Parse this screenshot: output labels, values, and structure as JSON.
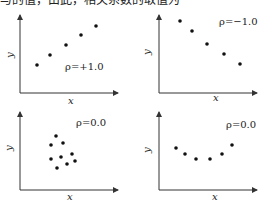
{
  "header": {
    "text": "与的值，由此，相关系数的取值为"
  },
  "chart_data": [
    {
      "type": "scatter",
      "title": "",
      "annotation": "ρ=+1.0",
      "xlabel": "x",
      "ylabel": "y",
      "grid": false,
      "points": [
        [
          1,
          1
        ],
        [
          2,
          2
        ],
        [
          3,
          3
        ],
        [
          4,
          4
        ],
        [
          5,
          5
        ]
      ],
      "px": {
        "axis_x": 20,
        "axis_y": 93,
        "x_end": 118,
        "y_top": 15,
        "label_pos": [
          65,
          70
        ],
        "xlabel_pos": [
          68,
          104
        ],
        "ylabel_pos": [
          13,
          58
        ],
        "dots": [
          [
            37,
            65
          ],
          [
            50,
            55
          ],
          [
            66,
            45
          ],
          [
            81,
            35
          ],
          [
            96,
            26
          ]
        ]
      }
    },
    {
      "type": "scatter",
      "title": "",
      "annotation": "ρ=−1.0",
      "xlabel": "x",
      "ylabel": "y",
      "grid": false,
      "points": [
        [
          1,
          5
        ],
        [
          2,
          4
        ],
        [
          3,
          3
        ],
        [
          4,
          2
        ],
        [
          5,
          1
        ]
      ],
      "px": {
        "axis_x": 159,
        "axis_y": 93,
        "x_end": 257,
        "y_top": 15,
        "label_pos": [
          219,
          25
        ],
        "xlabel_pos": [
          213,
          101
        ],
        "ylabel_pos": [
          150,
          55
        ],
        "dots": [
          [
            180,
            21
          ],
          [
            192,
            31
          ],
          [
            207,
            44
          ],
          [
            224,
            54
          ],
          [
            240,
            64
          ]
        ]
      }
    },
    {
      "type": "scatter",
      "title": "",
      "annotation": "ρ=0.0",
      "xlabel": "x",
      "ylabel": "y",
      "grid": false,
      "points": [
        [
          2,
          5
        ],
        [
          1,
          4
        ],
        [
          3,
          4
        ],
        [
          1,
          2.5
        ],
        [
          2.5,
          2.5
        ],
        [
          2,
          1.5
        ],
        [
          4,
          3
        ],
        [
          3.5,
          2
        ],
        [
          4.5,
          2.2
        ]
      ],
      "px": {
        "axis_x": 20,
        "axis_y": 190,
        "x_end": 118,
        "y_top": 112,
        "label_pos": [
          76,
          126
        ],
        "xlabel_pos": [
          67,
          200
        ],
        "ylabel_pos": [
          12,
          151
        ],
        "dots": [
          [
            56,
            136
          ],
          [
            51,
            145
          ],
          [
            63,
            143
          ],
          [
            51,
            159
          ],
          [
            61,
            157
          ],
          [
            57,
            168
          ],
          [
            72,
            154
          ],
          [
            67,
            164
          ],
          [
            75,
            161
          ]
        ]
      }
    },
    {
      "type": "scatter",
      "title": "",
      "annotation": "ρ=0.0",
      "xlabel": "x",
      "ylabel": "y",
      "grid": false,
      "points": [
        [
          1,
          4
        ],
        [
          2,
          3
        ],
        [
          3,
          2.2
        ],
        [
          4,
          2.2
        ],
        [
          5,
          3
        ],
        [
          6,
          4.5
        ]
      ],
      "px": {
        "axis_x": 159,
        "axis_y": 190,
        "x_end": 257,
        "y_top": 112,
        "label_pos": [
          226,
          128
        ],
        "xlabel_pos": [
          212,
          200
        ],
        "ylabel_pos": [
          150,
          153
        ],
        "dots": [
          [
            176,
            148
          ],
          [
            185,
            154
          ],
          [
            196,
            159
          ],
          [
            210,
            159
          ],
          [
            222,
            154
          ],
          [
            232,
            145
          ]
        ]
      }
    }
  ]
}
